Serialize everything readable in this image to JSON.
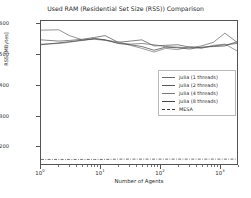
{
  "chart_data": {
    "type": "line",
    "title": "Used RAM (Residential Set Size (RSS)) Comparison",
    "xlabel": "Number of Agents",
    "ylabel": "RSS [MBytes]",
    "xscale": "log",
    "yscale": "linear",
    "xlim": [
      1,
      2000
    ],
    "ylim": [
      140,
      610
    ],
    "grid": false,
    "legend_position": "center right",
    "yticks": [
      200,
      300,
      400,
      500,
      600
    ],
    "xticks": [
      "10^0",
      "10^1",
      "10^2",
      "10^3"
    ],
    "xtick_labels": [
      {
        "base": "10",
        "exp": "0"
      },
      {
        "base": "10",
        "exp": "1"
      },
      {
        "base": "10",
        "exp": "2"
      },
      {
        "base": "10",
        "exp": "3"
      }
    ],
    "x": [
      1,
      2,
      3,
      5,
      8,
      12,
      20,
      32,
      50,
      80,
      125,
      200,
      320,
      500,
      800,
      1250,
      2000
    ],
    "series": [
      {
        "name": "julia (1 threads)",
        "color": "#6b6b6b",
        "style": "solid",
        "values": [
          580,
          581,
          562,
          548,
          552,
          548,
          538,
          534,
          536,
          532,
          526,
          524,
          522,
          528,
          540,
          570,
          540
        ]
      },
      {
        "name": "julia (2 threads)",
        "color": "#585858",
        "style": "solid",
        "values": [
          548,
          544,
          546,
          550,
          556,
          562,
          540,
          544,
          548,
          528,
          530,
          532,
          524,
          522,
          528,
          532,
          536
        ]
      },
      {
        "name": "julia (4 threads)",
        "color": "#7a7a7a",
        "style": "solid",
        "values": [
          534,
          536,
          540,
          548,
          550,
          546,
          542,
          530,
          520,
          508,
          520,
          516,
          526,
          520,
          530,
          534,
          512
        ]
      },
      {
        "name": "julia (8 threads)",
        "color": "#484848",
        "style": "solid",
        "values": [
          532,
          538,
          542,
          546,
          552,
          548,
          536,
          532,
          526,
          514,
          524,
          522,
          518,
          524,
          526,
          528,
          542
        ]
      },
      {
        "name": "MESA",
        "color": "#3d3d3d",
        "style": "dashdot",
        "values": [
          155,
          155,
          155,
          155,
          155,
          155,
          156,
          156,
          156,
          156,
          156,
          156,
          156,
          156,
          156,
          156,
          156
        ]
      }
    ]
  }
}
